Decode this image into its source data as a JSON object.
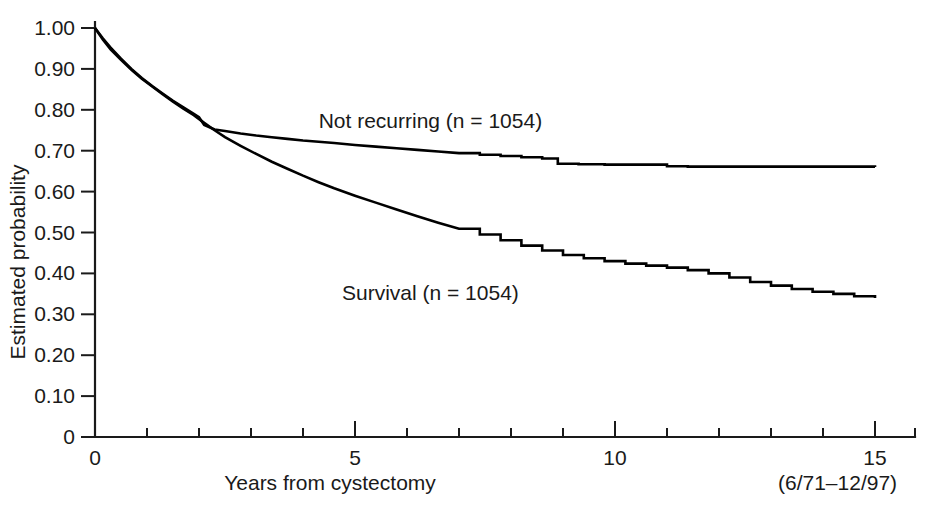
{
  "chart_data": {
    "type": "line",
    "title": "",
    "xlabel": "Years from cystectomy",
    "ylabel": "Estimated probability",
    "xlim": [
      0,
      15.6
    ],
    "ylim": [
      0,
      1.0
    ],
    "grid": false,
    "legend_position": "inline-annotation",
    "note": "(6/71–12/97)",
    "x_ticks": [
      0,
      1,
      2,
      3,
      4,
      5,
      6,
      7,
      8,
      9,
      10,
      11,
      12,
      13,
      14,
      15
    ],
    "x_tick_labels": [
      "0",
      "",
      "",
      "",
      "",
      "5",
      "",
      "",
      "",
      "",
      "10",
      "",
      "",
      "",
      "",
      "15"
    ],
    "y_ticks": [
      0,
      0.1,
      0.2,
      0.3,
      0.4,
      0.5,
      0.6,
      0.7,
      0.8,
      0.9,
      1.0
    ],
    "y_tick_labels": [
      "0",
      "0.10",
      "0.20",
      "0.30",
      "0.40",
      "0.50",
      "0.60",
      "0.70",
      "0.80",
      "0.90",
      "1.00"
    ],
    "series": [
      {
        "name": "Not recurring (n = 1054)",
        "label": "Not recurring (n = 1054)",
        "n": 1054,
        "color": "#000000",
        "x": [
          0,
          0.15,
          0.3,
          0.5,
          0.7,
          0.9,
          1.1,
          1.3,
          1.5,
          1.7,
          1.9,
          2.0,
          2.1,
          2.3,
          2.5,
          2.8,
          3.1,
          3.4,
          3.7,
          4.0,
          4.3,
          4.6,
          5.0,
          5.4,
          5.8,
          6.2,
          6.6,
          7.0,
          7.4,
          7.8,
          8.2,
          8.6,
          8.9,
          9.3,
          9.8,
          10.3,
          10.8,
          11.0,
          11.4,
          12.0,
          12.6,
          13.2,
          13.8,
          14.4,
          15.0
        ],
        "y": [
          1.0,
          0.975,
          0.952,
          0.925,
          0.9,
          0.878,
          0.858,
          0.84,
          0.822,
          0.806,
          0.79,
          0.782,
          0.763,
          0.752,
          0.748,
          0.742,
          0.737,
          0.733,
          0.729,
          0.725,
          0.722,
          0.719,
          0.714,
          0.71,
          0.706,
          0.702,
          0.698,
          0.694,
          0.69,
          0.687,
          0.684,
          0.681,
          0.668,
          0.667,
          0.666,
          0.666,
          0.666,
          0.662,
          0.661,
          0.661,
          0.661,
          0.661,
          0.661,
          0.661,
          0.66
        ]
      },
      {
        "name": "Survival (n = 1054)",
        "label": "Survival (n = 1054)",
        "n": 1054,
        "color": "#000000",
        "x": [
          0,
          0.15,
          0.3,
          0.5,
          0.7,
          0.9,
          1.1,
          1.3,
          1.5,
          1.7,
          1.9,
          2.1,
          2.3,
          2.5,
          2.8,
          3.1,
          3.4,
          3.7,
          4.0,
          4.3,
          4.6,
          5.0,
          5.4,
          5.8,
          6.2,
          6.6,
          7.0,
          7.4,
          7.8,
          8.2,
          8.6,
          9.0,
          9.4,
          9.8,
          10.2,
          10.6,
          11.0,
          11.4,
          11.8,
          12.2,
          12.6,
          13.0,
          13.4,
          13.8,
          14.2,
          14.6,
          15.0
        ],
        "y": [
          1.0,
          0.972,
          0.948,
          0.922,
          0.898,
          0.876,
          0.857,
          0.838,
          0.82,
          0.803,
          0.787,
          0.768,
          0.75,
          0.733,
          0.712,
          0.692,
          0.673,
          0.656,
          0.639,
          0.623,
          0.608,
          0.59,
          0.573,
          0.556,
          0.54,
          0.524,
          0.509,
          0.495,
          0.481,
          0.468,
          0.456,
          0.445,
          0.437,
          0.43,
          0.424,
          0.419,
          0.414,
          0.408,
          0.4,
          0.39,
          0.379,
          0.37,
          0.362,
          0.355,
          0.35,
          0.344,
          0.34
        ]
      }
    ],
    "annotations": [
      {
        "text": "Not recurring (n = 1054)",
        "x": 6.45,
        "y": 0.755,
        "name": "not-recurring-label"
      },
      {
        "text": "Survival (n = 1054)",
        "x": 6.45,
        "y": 0.335,
        "name": "survival-label"
      }
    ]
  }
}
